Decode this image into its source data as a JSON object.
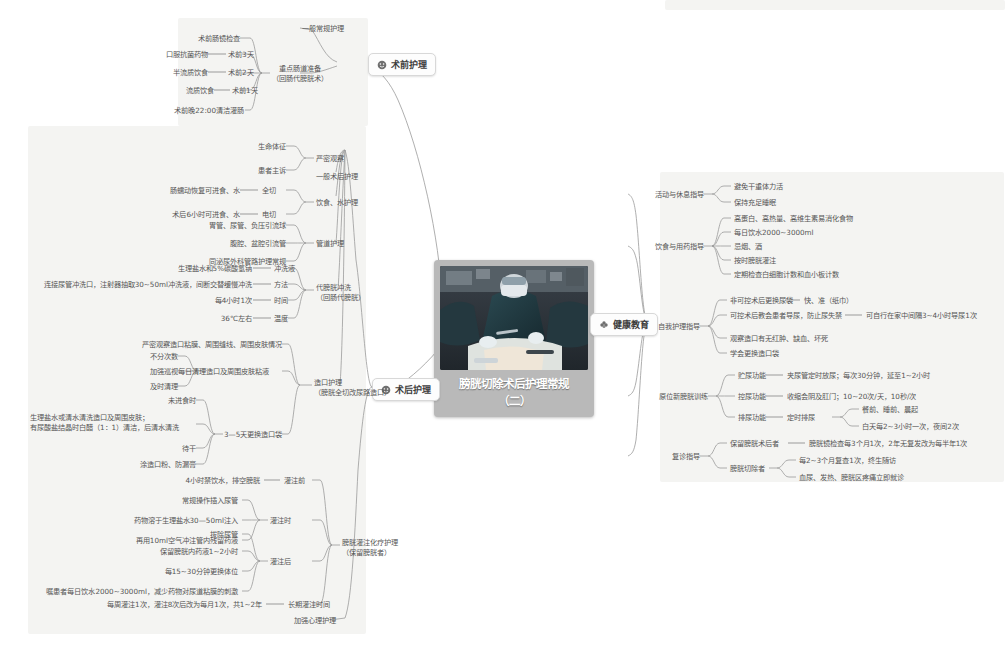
{
  "center": {
    "title_line1": "膀胱切除术后护理常规",
    "title_line2": "（二）",
    "photo_alt": "surgery-operating-room-photo"
  },
  "topics": {
    "preop": "术前护理",
    "postop": "术后护理",
    "health_edu": "健康教育"
  },
  "colors": {
    "panel_bg": "#f4f4f2",
    "center_bg": "#b9b9b9",
    "line": "#9a9a9a",
    "text": "#555555",
    "topic_border": "#d8d8d8"
  },
  "preop_branch": {
    "general": "一般常规护理",
    "bowel_prep_title_1": "重点肠道准备",
    "bowel_prep_title_2": "（回肠代膀胱术）",
    "items": [
      {
        "label": "术前肠镜检查",
        "value": ""
      },
      {
        "label": "口服抗菌药物",
        "value": "术前3天"
      },
      {
        "label": "半流质饮食",
        "value": "术前2天"
      },
      {
        "label": "流质饮食",
        "value": "术前1天"
      },
      {
        "label": "术前晚22:00清洁灌肠",
        "value": ""
      }
    ]
  },
  "postop_branch": {
    "close_observe": {
      "title": "严密观察",
      "items": [
        "生命体征",
        "患者主诉"
      ]
    },
    "general_postop": "一般术后护理",
    "diet_water": {
      "title": "饮食、水护理",
      "items": [
        {
          "label": "肠蠕动恢复可进食、水",
          "value": "全切"
        },
        {
          "label": "术后6小时可进食、水",
          "value": "电切"
        }
      ]
    },
    "tube_care": {
      "title": "管道护理",
      "items": [
        "胃管、尿管、负压引流球",
        "腹腔、盆腔引流管",
        "同泌尿外科管路护理常规"
      ]
    },
    "irrigation": {
      "title_1": "代膀胱冲洗",
      "title_2": "（回肠代膀胱）",
      "items": [
        {
          "label": "生理盐水和5%碳酸氢钠",
          "value": "冲洗液"
        },
        {
          "label": "连接尿管冲洗口，注射器抽取30~50ml冲洗液，间断交替缓慢冲洗",
          "value": "方法"
        },
        {
          "label": "每4小时1次",
          "value": "时间"
        },
        {
          "label": "36℃左右",
          "value": "温度"
        }
      ]
    },
    "stoma_care": {
      "title_1": "造口护理",
      "title_2": "（膀胱全切改尿路造口）",
      "observe": "严密观察造口粘膜、周围缝线、周围皮肤情况",
      "clean_title": "每日清理造口及周围皮肤粘液",
      "clean_items": [
        "不分次数",
        "加强巡视",
        "及时清理"
      ],
      "bag_title": "3—5天更换造口袋",
      "bag_items": [
        "未进食时",
        "生理盐水或清水清洗造口及周围皮肤；\n有尿酸盐结晶时白醋（1：1）清洁，后清水清洗",
        "待干",
        "涂造口粉、防漏膏"
      ],
      "bag_item_2a": "生理盐水或清水清洗造口及周围皮肤；",
      "bag_item_2b": "有尿酸盐结晶时白醋（1：1）清洁，后清水清洗"
    },
    "chemo": {
      "title_1": "膀胱灌注化疗护理",
      "title_2": "（保留膀胱者）",
      "before": {
        "title": "灌注前",
        "items": [
          "4小时禁饮水，排空膀胱"
        ]
      },
      "during": {
        "title": "灌注时",
        "items": [
          "常规操作插入尿管",
          "药物溶于生理盐水30—50ml注入",
          "再用10ml空气冲注管内残留药液"
        ]
      },
      "after": {
        "title": "灌注后",
        "items": [
          "拔除尿管",
          "保留膀胱内药液1~2小时",
          "每15~30分钟更换体位",
          "嘱患者每日饮水2000~3000ml，减少药物对尿道粘膜的刺激"
        ]
      },
      "long_term": {
        "title": "长期灌注时间",
        "items": [
          "每周灌注1次，灌注8次后改为每月1次，共1~2年"
        ]
      }
    },
    "psych": "加强心理护理"
  },
  "health_branch": {
    "activity": {
      "title": "活动与休息指导",
      "items": [
        "避免干重体力活",
        "保持充足睡眠"
      ]
    },
    "diet_drug": {
      "title": "饮食与用药指导",
      "items": [
        "高蛋白、高热量、高维生素易消化食物",
        "每日饮水2000~3000ml",
        "忌烟、酒",
        "按时膀胱灌注",
        "定期检查白细胞计数和血小板计数"
      ]
    },
    "self_care": {
      "title": "自我护理指导",
      "items": [
        {
          "label": "非可控术后更换尿袋",
          "value": "快、准（纸巾）"
        },
        {
          "label": "可控术后教会患者导尿，防止尿失禁",
          "value": "可自行在家中间隔3~4小时导尿1次"
        },
        {
          "label": "观察造口有无红肿、缺血、坏死",
          "value": ""
        },
        {
          "label": "学会更换造口袋",
          "value": ""
        }
      ]
    },
    "neobladder": {
      "title": "原位新膀胱训练",
      "items": [
        {
          "label": "贮尿功能",
          "value": "夹尿管定时放尿；每次30分钟，延至1~2小时"
        },
        {
          "label": "控尿功能",
          "value": "收缩会阴及肛门；10~20次/天，10秒/次"
        },
        {
          "label": "排尿功能",
          "value": "定时排尿"
        }
      ],
      "void_sub": [
        "餐前、睡前、晨起",
        "白天每2~3小时一次，夜间2次"
      ]
    },
    "followup": {
      "title": "复诊指导",
      "items": [
        {
          "label": "保留膀胱术后者",
          "value": "膀胱镜检查每3个月1次，2年无复发改为每半年1次"
        },
        {
          "label": "膀胱切除者",
          "value": ""
        }
      ],
      "resect_sub": [
        "每2~3个月复查1次，终生随访",
        "血尿、发热、膀胱区疼痛立即就诊"
      ]
    }
  }
}
